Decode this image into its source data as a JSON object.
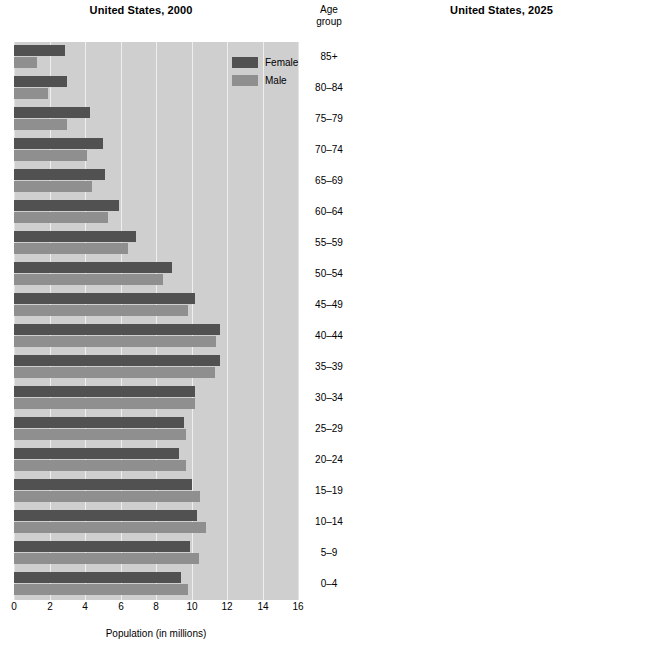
{
  "figure": {
    "agegroup_header_line1": "Age",
    "agegroup_header_line2": "group"
  },
  "panels": [
    {
      "id": "left",
      "title": "United States, 2000",
      "xlabel": "Population (in millions)",
      "legend": [
        {
          "label": "Female",
          "color": "#515151"
        },
        {
          "label": "Male",
          "color": "#8f8f8f"
        }
      ]
    },
    {
      "id": "right",
      "title": "United States, 2025",
      "xlabel": "Population (in millions)",
      "legend": [
        {
          "label": "Female",
          "color": "#8c8c8c"
        },
        {
          "label": "Male",
          "color": "#5a5a5a"
        }
      ]
    }
  ],
  "age_groups": [
    "85+",
    "80-84",
    "75-79",
    "70-74",
    "65-69",
    "60-64",
    "55-59",
    "50-54",
    "45-49",
    "40-44",
    "35-39",
    "30-34",
    "25-29",
    "20-24",
    "15-19",
    "10-14",
    "5-9",
    "0-4"
  ],
  "ticks": [
    "0",
    "2",
    "4",
    "6",
    "8",
    "10",
    "12",
    "14",
    "16"
  ],
  "chart_data": [
    {
      "type": "bar",
      "title": "United States, 2000",
      "xlabel": "Population (in millions)",
      "ylabel": "Age group",
      "xlim": [
        0,
        16
      ],
      "grid": true,
      "legend_position": "top-right",
      "orientation": "horizontal",
      "categories": [
        "85+",
        "80-84",
        "75-79",
        "70-74",
        "65-69",
        "60-64",
        "55-59",
        "50-54",
        "45-49",
        "40-44",
        "35-39",
        "30-34",
        "25-29",
        "20-24",
        "15-19",
        "10-14",
        "5-9",
        "0-4"
      ],
      "series": [
        {
          "name": "Female",
          "color": "#515151",
          "values": [
            2.9,
            3.0,
            4.3,
            5.0,
            5.1,
            5.9,
            6.9,
            8.9,
            10.2,
            11.6,
            11.6,
            10.2,
            9.6,
            9.3,
            10.0,
            10.3,
            9.9,
            9.4
          ]
        },
        {
          "name": "Male",
          "color": "#8f8f8f",
          "values": [
            1.3,
            1.9,
            3.0,
            4.1,
            4.4,
            5.3,
            6.4,
            8.4,
            9.8,
            11.4,
            11.3,
            10.2,
            9.7,
            9.7,
            10.5,
            10.8,
            10.4,
            9.8
          ]
        }
      ]
    },
    {
      "type": "bar",
      "title": "United States, 2025",
      "xlabel": "Population (in millions)",
      "ylabel": "Age group",
      "xlim": [
        0,
        16
      ],
      "grid": true,
      "legend_position": "top-right",
      "orientation": "horizontal",
      "categories": [
        "85+",
        "80-84",
        "75-79",
        "70-74",
        "65-69",
        "60-64",
        "55-59",
        "50-54",
        "45-49",
        "40-44",
        "35-39",
        "30-34",
        "25-29",
        "20-24",
        "15-19",
        "10-14",
        "5-9",
        "0-4"
      ],
      "series": [
        {
          "name": "Female",
          "color": "#8c8c8c",
          "values": [
            5.3,
            4.0,
            6.9,
            8.7,
            9.4,
            11.0,
            10.2,
            10.4,
            10.5,
            11.1,
            11.4,
            11.4,
            10.9,
            11.1,
            11.2,
            11.4,
            11.5,
            11.9
          ]
        },
        {
          "name": "Male",
          "color": "#5a5a5a",
          "values": [
            3.1,
            3.1,
            5.4,
            7.4,
            9.3,
            10.2,
            9.9,
            10.0,
            10.3,
            11.0,
            11.5,
            11.6,
            11.2,
            11.4,
            11.6,
            11.8,
            11.8,
            12.1
          ]
        }
      ]
    }
  ]
}
